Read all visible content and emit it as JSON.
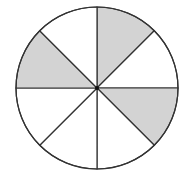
{
  "diagram": {
    "type": "fraction-circle",
    "total_parts": 8,
    "shaded_parts": 3,
    "fraction_shaded": "3/8",
    "center": [
      97,
      88
    ],
    "radius": 81,
    "colors": {
      "shaded": "#d3d3d3",
      "unshaded": "#ffffff",
      "stroke": "#333333"
    },
    "sectors": [
      {
        "index": 0,
        "start_deg": -90,
        "end_deg": -45,
        "shaded": true,
        "label": "top-right upper"
      },
      {
        "index": 1,
        "start_deg": -45,
        "end_deg": 0,
        "shaded": false,
        "label": "top-right lower"
      },
      {
        "index": 2,
        "start_deg": 0,
        "end_deg": 45,
        "shaded": true,
        "label": "bottom-right upper"
      },
      {
        "index": 3,
        "start_deg": 45,
        "end_deg": 90,
        "shaded": false,
        "label": "bottom-right lower"
      },
      {
        "index": 4,
        "start_deg": 90,
        "end_deg": 135,
        "shaded": false,
        "label": "bottom-left lower"
      },
      {
        "index": 5,
        "start_deg": 135,
        "end_deg": 180,
        "shaded": false,
        "label": "bottom-left upper"
      },
      {
        "index": 6,
        "start_deg": 180,
        "end_deg": 225,
        "shaded": true,
        "label": "top-left lower"
      },
      {
        "index": 7,
        "start_deg": 225,
        "end_deg": 270,
        "shaded": false,
        "label": "top-left upper"
      }
    ]
  }
}
